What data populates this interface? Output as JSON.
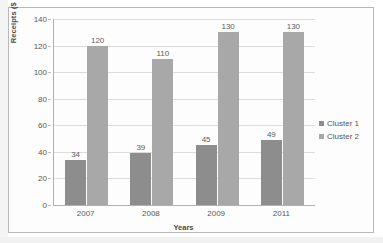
{
  "chart_data": {
    "type": "bar",
    "title": "",
    "subtitle": "",
    "xlabel": "Years",
    "ylabel": "Receipts ($ billion)",
    "categories": [
      "2007",
      "2008",
      "2009",
      "2011"
    ],
    "series": [
      {
        "name": "Cluster 1",
        "color": "#8d8d8d",
        "values": [
          34,
          39,
          45,
          49
        ]
      },
      {
        "name": "Cluster 2",
        "color": "#a8a8a8",
        "values": [
          120,
          110,
          130,
          130
        ]
      }
    ],
    "ylim": [
      0,
      140
    ],
    "ytick_step": 20,
    "yticks": [
      "140",
      "120",
      "100",
      "80",
      "60",
      "40",
      "20",
      "0"
    ],
    "ytick_values": [
      140,
      120,
      100,
      80,
      60,
      40,
      20,
      0
    ],
    "data_labels": [
      [
        "34",
        "39",
        "45",
        "49"
      ],
      [
        "120",
        "110",
        "130",
        "130"
      ]
    ],
    "grid": "horizontal",
    "legend_position": "right",
    "legend_entries": [
      "Cluster 1",
      "Cluster 2"
    ]
  },
  "legend": {
    "items": [
      {
        "label": "Cluster 1",
        "color": "#8d8d8d"
      },
      {
        "label": "Cluster 2",
        "color": "#a8a8a8"
      }
    ]
  }
}
